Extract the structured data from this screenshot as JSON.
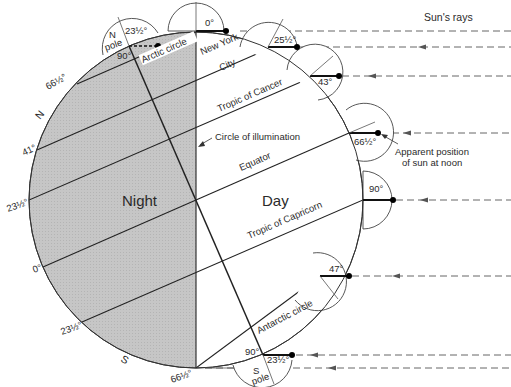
{
  "diagram": {
    "title": "Sun's rays",
    "colors": {
      "night_fill": "#c9c9c9",
      "day_fill": "#ffffff",
      "line": "#1e1e1e",
      "ray": "#555555"
    },
    "regions": {
      "night": "Night",
      "day": "Day"
    },
    "lines": {
      "circle_of_illumination": "Circle of illumination",
      "equator": "Equator",
      "tropic_cancer": "Tropic of Cancer",
      "tropic_capricorn": "Tropic of Capricorn",
      "arctic": "Arctic circle",
      "antarctic": "Antarctic circle",
      "new_york_1": "New York",
      "new_york_2": "City"
    },
    "hemispheres": {
      "north": "N",
      "south": "S"
    },
    "poles": {
      "north_1": "N",
      "north_2": "pole",
      "south_1": "S",
      "south_2": "pole",
      "north_angle": "23½°",
      "north_right": "90°",
      "south_angle": "23½°",
      "south_right": "90°"
    },
    "left_latitudes": {
      "arctic": "66½°",
      "ny": "41°",
      "cancer": "23½°",
      "equator": "0°",
      "capricorn": "23½°",
      "antarctic": "66½°"
    },
    "sun_angles": {
      "arctic": "0°",
      "ny": "25½°",
      "cancer": "43°",
      "equator": "66½°",
      "capricorn": "90°",
      "antarctic": "47°"
    },
    "annotation": {
      "line1": "Apparent position",
      "line2": "of sun at noon"
    }
  }
}
